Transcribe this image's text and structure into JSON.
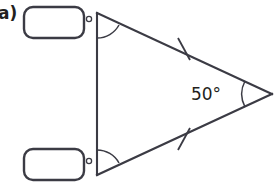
{
  "problem": {
    "part_label": "a)"
  },
  "figure": {
    "shape_name": "isosceles-triangle",
    "known_angle": {
      "label": "50°",
      "value": 50,
      "unit": "°",
      "vertex": "right"
    },
    "unknown_angles": [
      {
        "id": "top",
        "box_value": "",
        "box_placeholder": "",
        "unit_symbol": "°"
      },
      {
        "id": "bottom",
        "box_value": "",
        "box_placeholder": "",
        "unit_symbol": "°"
      }
    ],
    "congruent_side_marks": 2,
    "colors": {
      "ink": "#3b3b44",
      "text": "#231f20",
      "background": "#ffffff"
    }
  }
}
